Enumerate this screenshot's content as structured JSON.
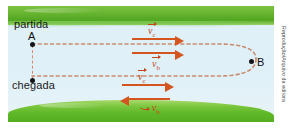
{
  "figure": {
    "labels": {
      "start": "partida",
      "finish": "chegada",
      "point_a": "A",
      "point_b": "B"
    },
    "vectors": [
      {
        "id": "v-current-top",
        "symbol": "v",
        "subscript": "c",
        "sign": "",
        "direction": "right",
        "label": "vc"
      },
      {
        "id": "v-boat-top",
        "symbol": "v",
        "subscript": "b",
        "sign": "",
        "direction": "right",
        "label": "vb"
      },
      {
        "id": "v-current-bot",
        "symbol": "v",
        "subscript": "c",
        "sign": "",
        "direction": "right",
        "label": "vc"
      },
      {
        "id": "v-boat-bot",
        "symbol": "v",
        "subscript": "b",
        "sign": "-",
        "direction": "left",
        "label": "-vb"
      }
    ],
    "credit": "Reprodução/Arquivo da editora",
    "colors": {
      "vector": "#d4551f",
      "vector_label": "#c2471a",
      "water": "#dff0f7",
      "grass_top": "#63b22e",
      "grass_bottom": "#5fb828",
      "path_dash": "#c98c6e",
      "point": "#14151a"
    }
  }
}
